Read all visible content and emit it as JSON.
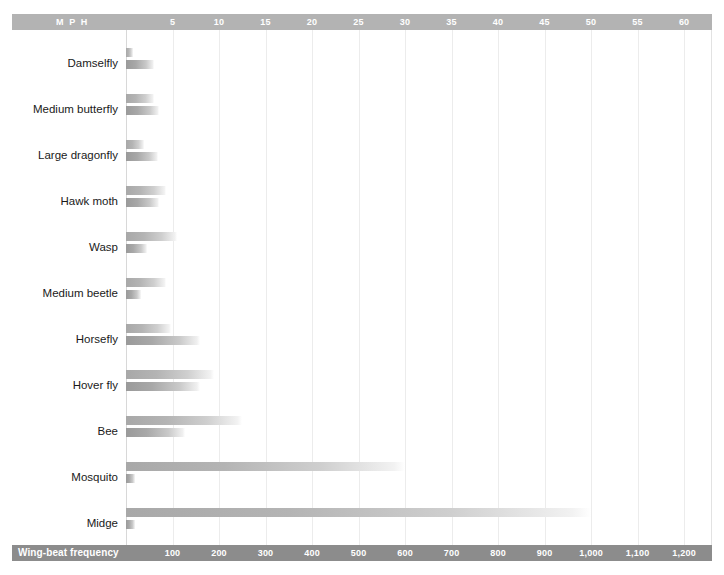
{
  "axes": {
    "top": {
      "title": "M P H",
      "ticks": [
        5,
        10,
        15,
        20,
        25,
        30,
        35,
        40,
        45,
        50,
        55,
        60
      ],
      "max": 63,
      "color": "#b3b3b3"
    },
    "bottom": {
      "title": "Wing-beat frequency",
      "ticks": [
        "100",
        "200",
        "300",
        "400",
        "500",
        "600",
        "700",
        "800",
        "900",
        "1,000",
        "1,100",
        "1,200"
      ],
      "tick_values": [
        100,
        200,
        300,
        400,
        500,
        600,
        700,
        800,
        900,
        1000,
        1100,
        1200
      ],
      "max": 1260,
      "color": "#8c8c8c"
    }
  },
  "chart_data": {
    "type": "bar",
    "title": "",
    "subtitle": "",
    "orientation": "horizontal",
    "categories": [
      "Damselfly",
      "Medium butterfly",
      "Large dragonfly",
      "Hawk moth",
      "Wasp",
      "Medium beetle",
      "Horsefly",
      "Hover fly",
      "Bee",
      "Mosquito",
      "Midge"
    ],
    "series": [
      {
        "name": "Wing-beat frequency",
        "unit": "beats per second",
        "axis": "bottom",
        "axis_label": "Wing-beat frequency",
        "max": 1260,
        "values": [
          16,
          60,
          38,
          85,
          110,
          85,
          96,
          190,
          250,
          600,
          1000
        ]
      },
      {
        "name": "MPH",
        "unit": "miles per hour",
        "axis": "top",
        "axis_label": "M P H",
        "max": 63,
        "values": [
          3.0,
          3.6,
          3.4,
          3.6,
          2.3,
          1.6,
          8.0,
          8.0,
          6.3,
          1.0,
          1.0
        ]
      }
    ],
    "xlabel": "",
    "ylabel": "",
    "grid": true,
    "legend": "none"
  },
  "colors": {
    "axis_top": "#b3b3b3",
    "axis_bottom": "#8c8c8c",
    "bar_wing": "#a8a8a8",
    "bar_mph": "#9a9a9a",
    "gridline": "#ececec",
    "label_text": "#1a1a1a",
    "axis_text": "#ffffff",
    "background": "#ffffff"
  }
}
